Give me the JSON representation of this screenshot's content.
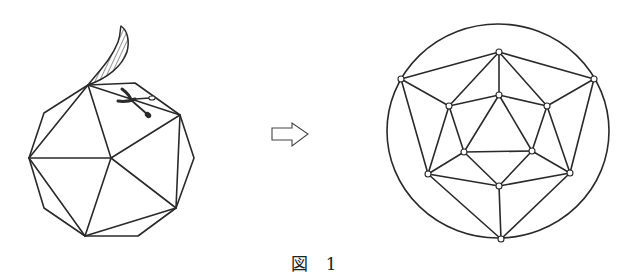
{
  "figure": {
    "caption": "図 1",
    "left_panel": {
      "label": "polyhedron with peel being cut",
      "icons": [
        "scissors-icon",
        "peel-flap"
      ]
    },
    "arrow": {
      "icon": "right-arrow-icon",
      "meaning": "transforms to"
    },
    "right_panel": {
      "label": "planar graph (Schlegel diagram) of the polyhedron",
      "vertex_count": 12
    }
  }
}
